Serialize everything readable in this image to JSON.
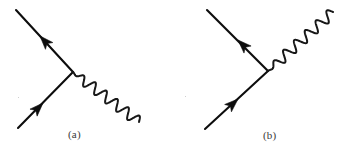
{
  "figure": {
    "kind": "feynman-diagram-pair",
    "background_color": "#ffffff",
    "line_color": "#0d0d0d",
    "caption_color": "#3a3a3a",
    "width": 347,
    "height": 149,
    "panels": [
      {
        "id": "a",
        "caption": "(a)",
        "vertex": {
          "x": 73,
          "y": 72
        },
        "fermion_in": {
          "name": "incoming-fermion",
          "from": {
            "x": 18,
            "y": 128
          },
          "to": {
            "x": 73,
            "y": 72
          },
          "arrow_at": {
            "x": 43,
            "y": 103
          },
          "arrow_direction": "up-right"
        },
        "fermion_out": {
          "name": "outgoing-fermion",
          "from": {
            "x": 73,
            "y": 72
          },
          "to": {
            "x": 16,
            "y": 10
          },
          "arrow_at": {
            "x": 40,
            "y": 36
          },
          "arrow_direction": "up-left"
        },
        "photon": {
          "name": "photon-wavy-line",
          "from": {
            "x": 73,
            "y": 72
          },
          "to": {
            "x": 139,
            "y": 122
          },
          "cycles": 6,
          "amplitude": 5.2,
          "direction": "down-right"
        }
      },
      {
        "id": "b",
        "caption": "(b)",
        "vertex": {
          "x": 268,
          "y": 71
        },
        "fermion_in": {
          "name": "incoming-fermion",
          "from": {
            "x": 205,
            "y": 129
          },
          "to": {
            "x": 268,
            "y": 71
          },
          "arrow_at": {
            "x": 238,
            "y": 99
          },
          "arrow_direction": "up-right"
        },
        "fermion_out": {
          "name": "outgoing-fermion",
          "from": {
            "x": 268,
            "y": 71
          },
          "to": {
            "x": 207,
            "y": 10
          },
          "arrow_at": {
            "x": 238,
            "y": 40
          },
          "arrow_direction": "up-left"
        },
        "photon": {
          "name": "photon-wavy-line",
          "from": {
            "x": 268,
            "y": 71
          },
          "to": {
            "x": 333,
            "y": 12
          },
          "cycles": 6,
          "amplitude": 5.2,
          "direction": "up-right"
        }
      }
    ]
  }
}
